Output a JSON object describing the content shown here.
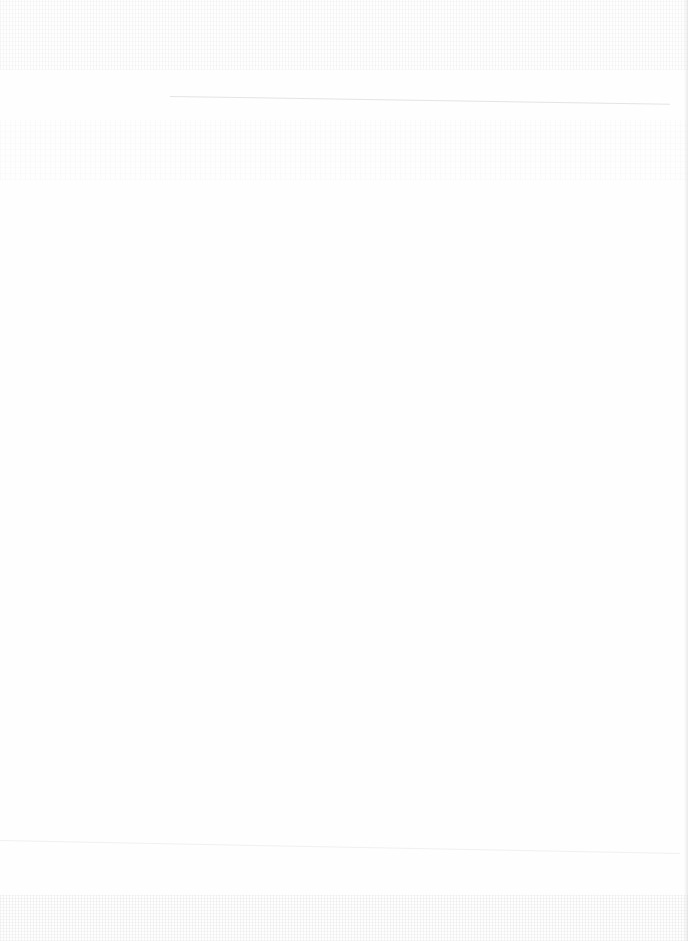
{
  "page": {
    "type": "blank-scanned-page",
    "background_color": "#fefefe",
    "visible_text": []
  }
}
